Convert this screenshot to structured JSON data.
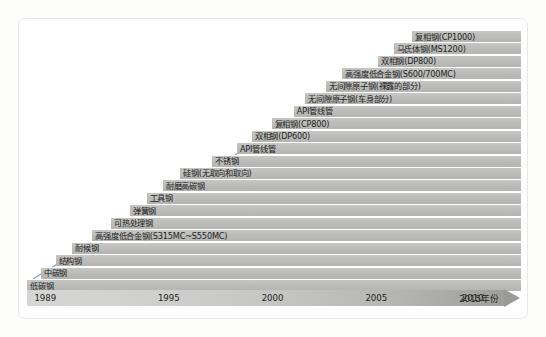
{
  "chart_data": {
    "type": "bar",
    "title": "",
    "subtitle": "",
    "xlabel": "年份",
    "ylabel": "",
    "grid": false,
    "legend": null,
    "orientation": "horizontal-stacked-staircase",
    "axis": {
      "tick_labels": [
        "1989",
        "1995",
        "2000",
        "2005",
        "2010",
        "2015年份"
      ],
      "tick_values": [
        1989,
        1995,
        2000,
        2005,
        2010,
        2015
      ],
      "tick_positions_pct": [
        1.5,
        26.5,
        47.5,
        68.5,
        88.0,
        99.0
      ],
      "xlim": [
        1989,
        2016
      ],
      "arrow_end": true
    },
    "annotation": {
      "trend_arrow": "diagonal rising arrow from bottom-left to top-right",
      "arrow_color": "#7e8fa8"
    },
    "bar_color": "#bdbdbb",
    "categories": [
      "低碳钢",
      "中碳钢",
      "结构钢",
      "耐候钢",
      "高强度低合金钢(S315MC~S550MC)",
      "可热处理钢",
      "弹簧钢",
      "工具钢",
      "耐磨高碳钢",
      "硅钢(无取向和取向)",
      "不锈钢",
      "API管线管",
      "双相钢(DP600)",
      "复相钢(CP800)",
      "API管线管",
      "无间隙原子钢(车身部分)",
      "无间隙原子钢(裸露的部分)",
      "高强度低合金钢(S600/700MC)",
      "双相钢(DP800)",
      "马氏体钢(MS1200)",
      "复相钢(CP1000)"
    ],
    "series": [
      {
        "name": "introduction year (bar start)",
        "values": [
          1989,
          1990,
          1991.2,
          1992.4,
          1994.2,
          1995.6,
          1996.6,
          1997.6,
          1998.8,
          2000.2,
          2001.5,
          2002.6,
          2003.6,
          2004.6,
          2005.7,
          2006.7,
          2007.7,
          2008.8,
          2009.9,
          2010.9,
          2011.9
        ]
      }
    ],
    "bars": [
      {
        "label": "复相钢(CP1000)",
        "start_pct": 78.0,
        "label_pct": 78.5
      },
      {
        "label": "马氏体钢(MS1200)",
        "start_pct": 74.2,
        "label_pct": 74.7
      },
      {
        "label": "双相钢(DP800)",
        "start_pct": 71.0,
        "label_pct": 71.5
      },
      {
        "label": "高强度低合金钢(S600/700MC)",
        "start_pct": 63.8,
        "label_pct": 64.3
      },
      {
        "label": "无间隙原子钢(裸露的部分)",
        "start_pct": 60.5,
        "label_pct": 61.0
      },
      {
        "label": "无间隙原子钢(车身部分)",
        "start_pct": 56.3,
        "label_pct": 56.8
      },
      {
        "label": "API管线管",
        "start_pct": 54.0,
        "label_pct": 54.5
      },
      {
        "label": "复相钢(CP800)",
        "start_pct": 49.5,
        "label_pct": 50.0
      },
      {
        "label": "双相钢(DP600)",
        "start_pct": 45.5,
        "label_pct": 46.0
      },
      {
        "label": "API管线管",
        "start_pct": 42.5,
        "label_pct": 43.0
      },
      {
        "label": "不锈钢",
        "start_pct": 37.5,
        "label_pct": 38.0
      },
      {
        "label": "硅钢(无取向和取向)",
        "start_pct": 31.0,
        "label_pct": 31.5
      },
      {
        "label": "耐磨高碳钢",
        "start_pct": 27.5,
        "label_pct": 28.0
      },
      {
        "label": "工具钢",
        "start_pct": 24.2,
        "label_pct": 24.7
      },
      {
        "label": "弹簧钢",
        "start_pct": 20.8,
        "label_pct": 21.3
      },
      {
        "label": "可热处理钢",
        "start_pct": 17.0,
        "label_pct": 17.5
      },
      {
        "label": "高强度低合金钢(S315MC~S550MC)",
        "start_pct": 13.2,
        "label_pct": 13.7
      },
      {
        "label": "耐候钢",
        "start_pct": 9.2,
        "label_pct": 9.7
      },
      {
        "label": "结构钢",
        "start_pct": 5.8,
        "label_pct": 6.3
      },
      {
        "label": "中碳钢",
        "start_pct": 2.8,
        "label_pct": 3.3
      },
      {
        "label": "低碳钢",
        "start_pct": 0.0,
        "label_pct": 0.6
      }
    ]
  }
}
